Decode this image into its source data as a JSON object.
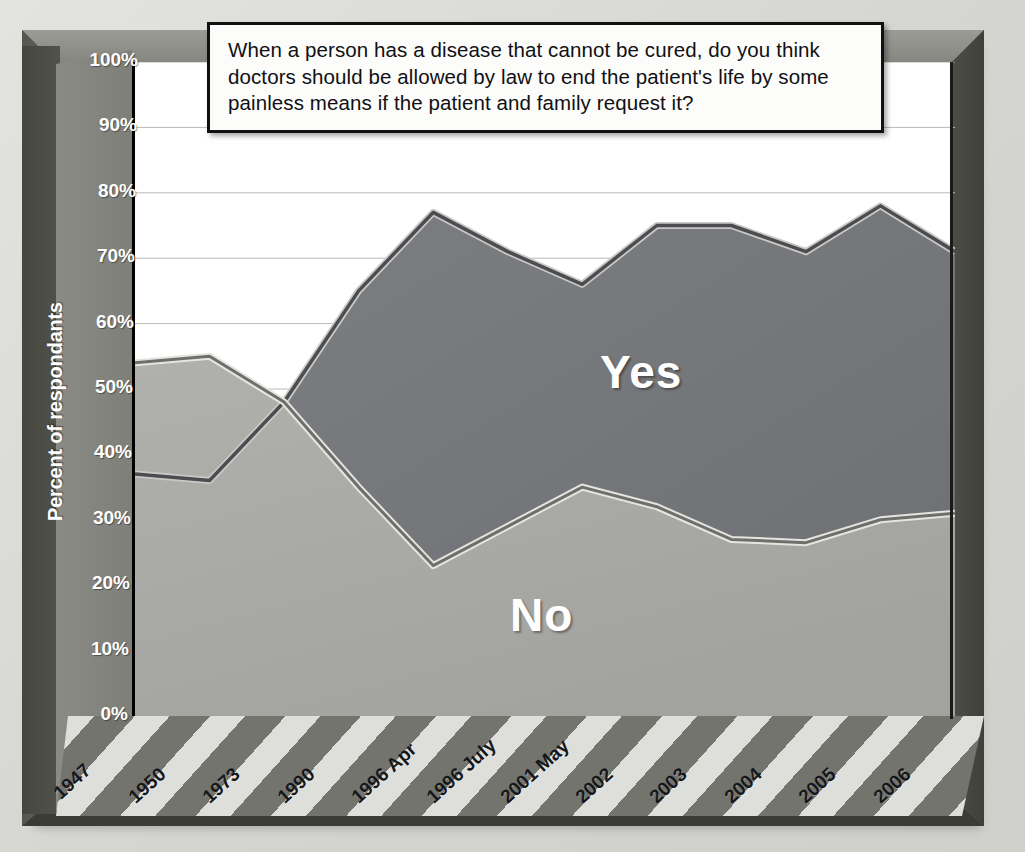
{
  "figure": {
    "question_title": "When a person has a disease that cannot be cured, do you think doctors should be allowed by law to end the patient's life by some painless means if the patient and family request it?",
    "y_axis_title": "Percent of respondants",
    "series_label_yes": "Yes",
    "series_label_no": "No"
  },
  "colors": {
    "yes_fill": "#76777a",
    "yes_line": "#4c4d50",
    "no_fill": "#a9aaa6",
    "no_line": "#6e6f6b",
    "band_light": "#dedfdb",
    "band_dark": "#73746e",
    "frame": "#6f7069",
    "plot_background": "#ffffff",
    "axis": "#000000",
    "label_text": "#ffffff"
  },
  "chart_data": {
    "type": "area",
    "title": "When a person has a disease that cannot be cured, do you think doctors should be allowed by law to end the patient's life by some painless means if the patient and family request it?",
    "xlabel": "",
    "ylabel": "Percent of respondants",
    "ylim": [
      0,
      100
    ],
    "yticks": [
      "0%",
      "10%",
      "20%",
      "30%",
      "40%",
      "50%",
      "60%",
      "70%",
      "80%",
      "90%",
      "100%"
    ],
    "ytick_values": [
      0,
      10,
      20,
      30,
      40,
      50,
      60,
      70,
      80,
      90,
      100
    ],
    "grid": true,
    "legend": "inline-labels",
    "categories": [
      "1947",
      "1950",
      "1973",
      "1990",
      "1996 Apr",
      "1996 July",
      "2001 May",
      "2002",
      "2003",
      "2004",
      "2005",
      "2006"
    ],
    "series": [
      {
        "name": "Yes",
        "values": [
          37,
          36,
          48,
          65,
          77,
          71,
          66,
          75,
          75,
          71,
          78,
          71
        ]
      },
      {
        "name": "No",
        "values": [
          54,
          55,
          48,
          35,
          23,
          29,
          35,
          32,
          27,
          26.5,
          30,
          31
        ]
      }
    ]
  },
  "x_axis": {
    "tick_labels": [
      "1947",
      "1950",
      "1973",
      "1990",
      "1996 Apr",
      "1996 July",
      "2001 May",
      "2002",
      "2003",
      "2004",
      "2005",
      "2006"
    ]
  }
}
